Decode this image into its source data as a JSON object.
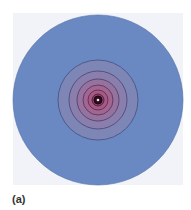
{
  "figure": {
    "label": "(a)",
    "center": [
      98,
      100
    ],
    "outer_circle": {
      "radius": 85,
      "fill": "#6a89c2",
      "stroke": "#4f6ea6"
    },
    "rings": [
      {
        "radius": 40,
        "fill": "#7e86b6",
        "stroke": "#4a5587"
      },
      {
        "radius": 29,
        "fill": "#8a7fac",
        "stroke": "#4f4a7a"
      },
      {
        "radius": 21,
        "fill": "#96739f",
        "stroke": "#553f6d"
      },
      {
        "radius": 15,
        "fill": "#a26690",
        "stroke": "#5a3660"
      },
      {
        "radius": 10,
        "fill": "#a85a84",
        "stroke": "#5b2f55"
      },
      {
        "radius": 6,
        "fill": "#8c3f66",
        "stroke": "#4a2040"
      },
      {
        "radius": 4,
        "fill": "#2a0d1c",
        "stroke": "#1a0510"
      }
    ],
    "core_dot": {
      "radius": 1.3,
      "fill": "#f4e6ee"
    }
  }
}
